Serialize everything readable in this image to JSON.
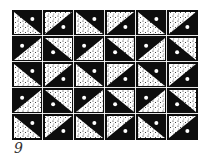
{
  "figure": {
    "caption": "9",
    "grid": {
      "columns": 6,
      "rows": 5
    },
    "colors": {
      "ink": "#0d0d0d",
      "paper": "#ffffff",
      "stipple": "#0d0d0d"
    },
    "tile_legend": {
      "TR": "black triangle in top-right corner with white dot, stippled bottom-left",
      "BR": "black triangle in bottom-right corner with white dot, stippled top-left",
      "TL": "black triangle in top-left corner with white dot, stippled bottom-right",
      "BL": "black triangle in bottom-left corner with white dot, stippled top-right"
    },
    "rows": [
      [
        "TR",
        "BR",
        "TR",
        "BR",
        "TR",
        "BR"
      ],
      [
        "TL",
        "BL",
        "TL",
        "BL",
        "TL",
        "BL"
      ],
      [
        "TR",
        "BR",
        "TR",
        "BR",
        "TR",
        "BR"
      ],
      [
        "TL",
        "BL",
        "TL",
        "BL",
        "TL",
        "BL"
      ],
      [
        "TR",
        "BR",
        "TR",
        "BR",
        "TR",
        "BR"
      ]
    ]
  }
}
